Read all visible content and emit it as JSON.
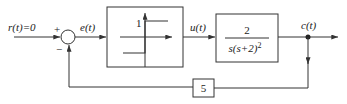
{
  "diagram": {
    "type": "control-system-block-diagram",
    "signals": {
      "input": "r(t)=0",
      "error": "e(t)",
      "control": "u(t)",
      "output": "c(t)"
    },
    "summing_junction": {
      "plus_sign": "+",
      "minus_sign": "−"
    },
    "nonlinear_block": {
      "type": "ideal relay",
      "level_label": "1"
    },
    "plant_block": {
      "numerator": "2",
      "denominator": "s(s+2)²",
      "denominator_base": "s(s+2)",
      "denominator_exp": "2"
    },
    "feedback_block": {
      "gain": "5"
    },
    "colors": {
      "line": "#333333",
      "background": "#ffffff"
    }
  }
}
